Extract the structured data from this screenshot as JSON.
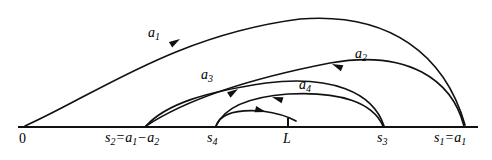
{
  "figure": {
    "type": "mathematical-diagram",
    "background_color": "#ffffff",
    "stroke_color": "#111111"
  },
  "axis": {
    "name": "number-line",
    "y": 127,
    "x_start": 18,
    "x_end": 478,
    "ticks": [
      {
        "id": "L",
        "x": 288,
        "has_tick_mark": true
      }
    ]
  },
  "points": [
    {
      "id": "p0",
      "label_plain": "0",
      "x": 25,
      "label_x": 20,
      "label_y": 134
    },
    {
      "id": "s2",
      "label_plain": "s2 = a1 - a2",
      "x": 145,
      "label_x": 106,
      "label_y": 133
    },
    {
      "id": "s4",
      "label_plain": "s4",
      "x": 215,
      "label_x": 208,
      "label_y": 134
    },
    {
      "id": "L",
      "label_plain": "L",
      "x": 288,
      "label_x": 284,
      "label_y": 135
    },
    {
      "id": "s3",
      "label_plain": "s3",
      "x": 384,
      "label_x": 377,
      "label_y": 134
    },
    {
      "id": "s1",
      "label_plain": "s1 = a1",
      "x": 464,
      "label_x": 436,
      "label_y": 133
    }
  ],
  "arc_labels": [
    {
      "id": "a1",
      "base": "a",
      "subscript": "1",
      "x": 152,
      "y": 28
    },
    {
      "id": "a2",
      "base": "a",
      "subscript": "2",
      "x": 358,
      "y": 49
    },
    {
      "id": "a3",
      "base": "a",
      "subscript": "3",
      "x": 205,
      "y": 70
    },
    {
      "id": "a4",
      "base": "a",
      "subscript": "4",
      "x": 303,
      "y": 80
    }
  ],
  "point_labels": {
    "zero": "0",
    "s2_base": "s",
    "s2_sub": "2",
    "s2_eq": "=",
    "s2_a1_base": "a",
    "s2_a1_sub": "1",
    "s2_minus": "−",
    "s2_a2_base": "a",
    "s2_a2_sub": "2",
    "s4_base": "s",
    "s4_sub": "4",
    "L": "L",
    "s3_base": "s",
    "s3_sub": "3",
    "s1_base": "s",
    "s1_sub": "1",
    "s1_eq": "=",
    "s1_a1_base": "a",
    "s1_a1_sub": "1"
  },
  "arcs": [
    {
      "id": "arc-a1",
      "from": "p0",
      "to": "s1",
      "direction": "rightward",
      "arrow_at": {
        "x": 176,
        "y": 41,
        "angle": -32
      },
      "path": "M 25 126 C 95 95 175 35 300 19 C 390 12 445 55 465 125"
    },
    {
      "id": "arc-a2",
      "from": "s1",
      "to": "s2",
      "direction": "leftward",
      "arrow_at": {
        "x": 333,
        "y": 64,
        "angle": 204
      },
      "path": "M 464 126 C 450 78 405 50 330 64 C 260 77 192 96 146 126"
    },
    {
      "id": "arc-a3",
      "from": "s2",
      "to": "s3",
      "direction": "rightward",
      "arrow_at": {
        "x": 236,
        "y": 90,
        "angle": -37
      },
      "path": "M 146 126 C 168 106 205 93 265 83 C 330 75 372 92 384 126"
    },
    {
      "id": "arc-a4",
      "from": "s3",
      "to": "s4",
      "direction": "leftward",
      "arrow_at": {
        "x": 269,
        "y": 98,
        "angle": 199
      },
      "path": "M 383 126 C 372 104 340 92 288 95 C 248 98 224 108 216 126"
    },
    {
      "id": "arc-inner",
      "from": "s4",
      "to": "right",
      "direction": "rightward",
      "arrow_at": {
        "x": 262,
        "y": 113,
        "angle": -18
      },
      "path": "M 216 126 C 221 115 236 110 262 112 C 278 114 290 117 297 121"
    }
  ]
}
